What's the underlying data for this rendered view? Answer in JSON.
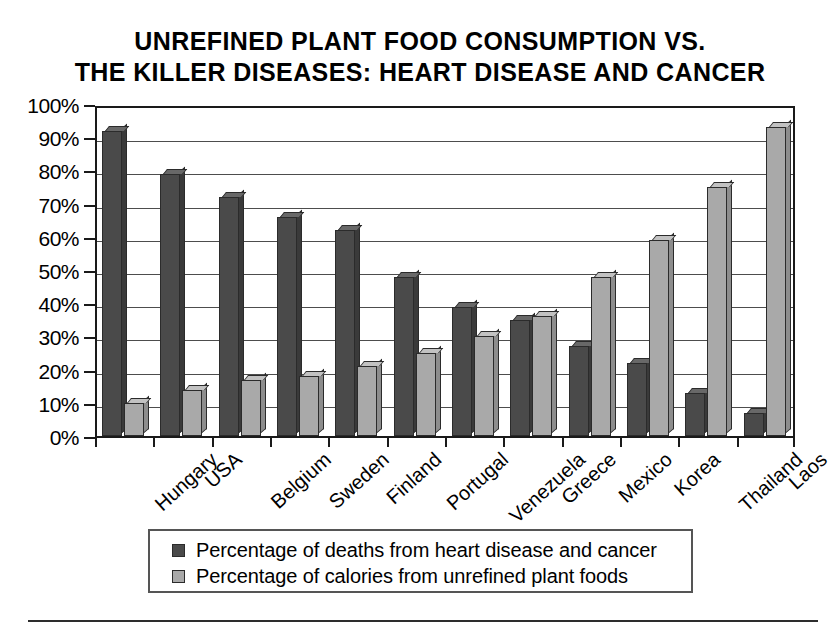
{
  "chart_data": {
    "type": "bar",
    "title": "UNREFINED PLANT FOOD CONSUMPTION VS. THE KILLER DISEASES: HEART DISEASE AND CANCER",
    "title_lines": [
      "UNREFINED PLANT FOOD CONSUMPTION VS.",
      "THE KILLER DISEASES: HEART DISEASE AND CANCER"
    ],
    "xlabel": "",
    "ylabel": "",
    "ylim": [
      0,
      100
    ],
    "ytick_labels": [
      "100%",
      "90%",
      "80%",
      "70%",
      "60%",
      "50%",
      "40%",
      "30%",
      "20%",
      "10%",
      "0%"
    ],
    "ytick_values": [
      100,
      90,
      80,
      70,
      60,
      50,
      40,
      30,
      20,
      10,
      0
    ],
    "grid": true,
    "legend_position": "bottom",
    "categories": [
      "Hungary",
      "USA",
      "Belgium",
      "Sweden",
      "Finland",
      "Portugal",
      "Venezuela",
      "Greece",
      "Mexico",
      "Korea",
      "Thailand",
      "Laos"
    ],
    "series": [
      {
        "name": "Percentage of deaths from heart disease and cancer",
        "key": "deaths",
        "color": "#4a4a4a",
        "values": [
          92,
          79,
          72,
          66,
          62,
          48,
          39,
          35,
          27,
          22,
          13,
          7
        ]
      },
      {
        "name": "Percentage of calories from unrefined plant foods",
        "key": "calories",
        "color": "#a9a9a9",
        "values": [
          10,
          14,
          17,
          18,
          21,
          25,
          30,
          36,
          48,
          59,
          75,
          93
        ]
      }
    ]
  },
  "legend": {
    "items": [
      {
        "label": "Percentage of deaths from heart disease and cancer",
        "swatch_class": "series-deaths"
      },
      {
        "label": "Percentage of calories from unrefined plant foods",
        "swatch_class": "series-calories"
      }
    ]
  }
}
